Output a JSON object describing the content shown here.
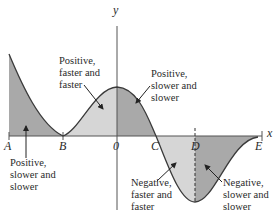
{
  "figure": {
    "axes": {
      "x_label": "x",
      "y_label": "y"
    },
    "points": {
      "A": "A",
      "B": "B",
      "O": "0",
      "C": "C",
      "D": "D",
      "E": "E"
    },
    "annotations": {
      "positive_slower_left": [
        "Positive,",
        "slower and",
        "slower"
      ],
      "positive_faster": [
        "Positive,",
        "faster and",
        "faster"
      ],
      "positive_slower_right": [
        "Positive,",
        "slower and",
        "slower"
      ],
      "negative_faster": [
        "Negative,",
        "faster and",
        "faster"
      ],
      "negative_slower": [
        "Negative,",
        "slower and",
        "slower"
      ]
    },
    "colors": {
      "dark_fill": "#a9a9a9",
      "light_fill": "#d6d6d6",
      "curve": "#3a3a3a",
      "axis": "#555555"
    }
  }
}
